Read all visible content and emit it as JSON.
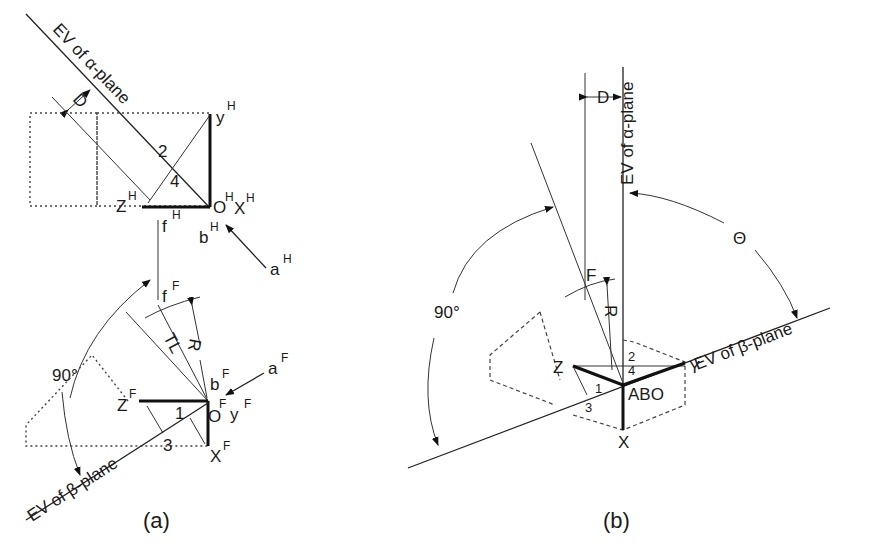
{
  "figure_a": {
    "caption": "(a)",
    "alpha_plane_label": "EV of α-plane",
    "beta_plane_label": "EV of β-plane",
    "distance_label": "D",
    "radius_label": "R",
    "true_length_label": "TL",
    "angle_label": "90°",
    "numbers": {
      "n1": "1",
      "n2": "2",
      "n3": "3",
      "n4": "4"
    },
    "horizontal_view": {
      "y": "y",
      "y_sup": "H",
      "z": "Z",
      "z_sup": "H",
      "o": "O",
      "o_sup": "H",
      "x": "X",
      "x_sup": "H",
      "f": "f",
      "f_sup": "H",
      "b": "b",
      "b_sup": "H",
      "a": "a",
      "a_sup": "H"
    },
    "front_view": {
      "f": "f",
      "f_sup": "F",
      "z": "Z",
      "z_sup": "F",
      "o": "O",
      "o_sup": "F",
      "y": "y",
      "y_sup": "F",
      "x": "X",
      "x_sup": "F",
      "b": "b",
      "b_sup": "F",
      "a": "a",
      "a_sup": "F"
    }
  },
  "figure_b": {
    "caption": "(b)",
    "alpha_plane_label": "EV of α-plane",
    "beta_plane_label": "EV of β-plane",
    "distance_label": "D",
    "radius_label": "R",
    "angle_90_label": "90°",
    "theta_label": "Θ",
    "points": {
      "f": "F",
      "z": "Z",
      "y": "Y",
      "x": "X",
      "abo": "ABO"
    },
    "numbers": {
      "n1": "1",
      "n2": "2",
      "n3": "3",
      "n4": "4"
    }
  }
}
